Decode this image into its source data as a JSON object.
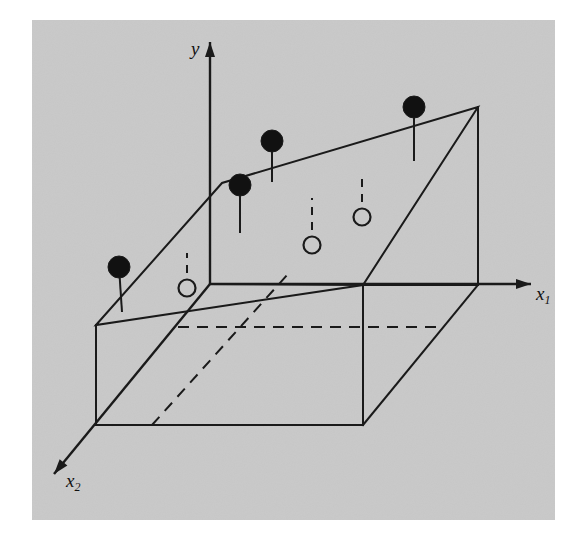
{
  "figure": {
    "background_color": "#ffffff",
    "plot_background_color": "#c9c9c9",
    "stroke_color": "#1a1a1a",
    "marker_fill_color": "#111111",
    "marker_open_color": "#c9c9c9",
    "plot_area": {
      "x": 32,
      "y": 20,
      "width": 523,
      "height": 500
    }
  },
  "axes": {
    "y": {
      "label": "y",
      "name": "vertical-response-axis",
      "from": [
        210,
        284
      ],
      "to": [
        210,
        42
      ],
      "arrow": true
    },
    "x1": {
      "label": "x",
      "subscript": "1",
      "name": "horizontal-predictor-axis",
      "from": [
        210,
        284
      ],
      "to": [
        531,
        284
      ],
      "arrow": true
    },
    "x2": {
      "label": "x",
      "subscript": "2",
      "name": "depth-predictor-axis",
      "from": [
        210,
        284
      ],
      "to": [
        54,
        474
      ],
      "arrow": true
    }
  },
  "chart_data": {
    "type": "scatter",
    "title": "",
    "xlabel": "x₁",
    "ylabel": "y",
    "zlabel": "x₂",
    "grid": false,
    "legend": null,
    "projection": "3d-oblique",
    "regression_plane": {
      "name": "fitted-regression-plane",
      "vertices": [
        [
          96,
          325
        ],
        [
          222,
          183
        ],
        [
          478,
          107
        ],
        [
          363,
          285
        ]
      ],
      "closed": true
    },
    "base_box": {
      "name": "reference-box",
      "solid_edges": [
        [
          [
            96,
            325
          ],
          [
            96,
            425
          ]
        ],
        [
          [
            96,
            425
          ],
          [
            363,
            425
          ]
        ],
        [
          [
            363,
            425
          ],
          [
            363,
            285
          ]
        ],
        [
          [
            363,
            285
          ],
          [
            478,
            285
          ]
        ],
        [
          [
            363,
            425
          ],
          [
            478,
            285
          ]
        ],
        [
          [
            478,
            285
          ],
          [
            478,
            107
          ]
        ],
        [
          [
            210,
            284
          ],
          [
            363,
            285
          ]
        ]
      ],
      "dashed_edges": [
        [
          [
            178,
            327
          ],
          [
            440,
            327
          ]
        ],
        [
          [
            152,
            425
          ],
          [
            288,
            274
          ]
        ]
      ]
    },
    "points": [
      {
        "id": "p1",
        "marker": "filled",
        "above_plane": true,
        "center": [
          119,
          267
        ],
        "radius": 11,
        "stem_to": [
          122,
          312
        ],
        "stem_style": "solid"
      },
      {
        "id": "p2",
        "marker": "filled",
        "above_plane": true,
        "center": [
          240,
          185
        ],
        "radius": 11,
        "stem_to": [
          240,
          233
        ],
        "stem_style": "solid"
      },
      {
        "id": "p3",
        "marker": "filled",
        "above_plane": true,
        "center": [
          272,
          141
        ],
        "radius": 11,
        "stem_to": [
          272,
          182
        ],
        "stem_style": "solid"
      },
      {
        "id": "p4",
        "marker": "filled",
        "above_plane": true,
        "center": [
          414,
          107
        ],
        "radius": 11,
        "stem_to": [
          414,
          161
        ],
        "stem_style": "solid"
      },
      {
        "id": "p5",
        "marker": "open",
        "above_plane": false,
        "center": [
          187,
          288
        ],
        "radius": 8.5,
        "stem_to": [
          187,
          253
        ],
        "stem_style": "dashed"
      },
      {
        "id": "p6",
        "marker": "open",
        "above_plane": false,
        "center": [
          312,
          245
        ],
        "radius": 8.5,
        "stem_to": [
          312,
          198
        ],
        "stem_style": "dashed"
      },
      {
        "id": "p7",
        "marker": "open",
        "above_plane": false,
        "center": [
          362,
          217
        ],
        "radius": 8.5,
        "stem_to": [
          362,
          173
        ],
        "stem_style": "dashed"
      }
    ]
  }
}
